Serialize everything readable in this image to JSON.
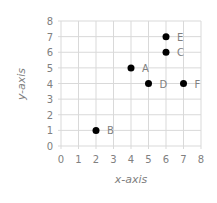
{
  "chart_data": {
    "type": "scatter",
    "title": "",
    "xlabel": "x-axis",
    "ylabel": "y-axis",
    "xlim": [
      0,
      8
    ],
    "ylim": [
      0,
      8
    ],
    "xticks": [
      0,
      1,
      2,
      3,
      4,
      5,
      6,
      7,
      8
    ],
    "yticks": [
      0,
      1,
      2,
      3,
      4,
      5,
      6,
      7,
      8
    ],
    "grid": true,
    "legend": null,
    "series": [
      {
        "name": "points",
        "color": "#000000",
        "points": [
          {
            "label": "A",
            "x": 4,
            "y": 5
          },
          {
            "label": "B",
            "x": 2,
            "y": 1
          },
          {
            "label": "C",
            "x": 6,
            "y": 6
          },
          {
            "label": "D",
            "x": 5,
            "y": 4
          },
          {
            "label": "E",
            "x": 6,
            "y": 7
          },
          {
            "label": "F",
            "x": 7,
            "y": 4
          }
        ]
      }
    ]
  },
  "colors": {
    "grid": "#d9d9d9",
    "text": "#808080",
    "marker": "#000000"
  }
}
